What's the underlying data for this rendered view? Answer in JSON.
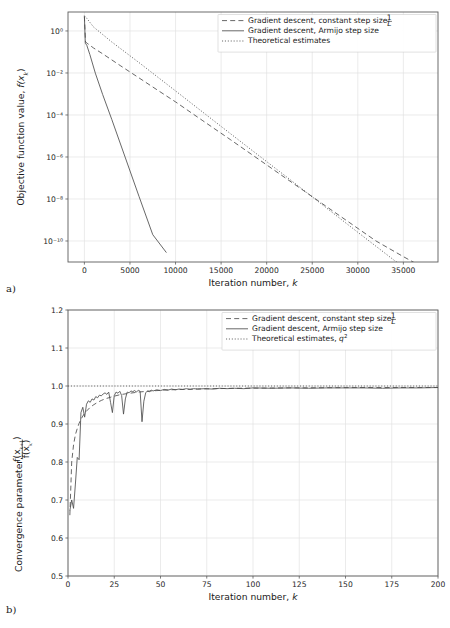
{
  "figure": {
    "panel_a_label": "a)",
    "panel_b_label": "b)",
    "background": "#ffffff",
    "line_color": "#4d4d4d",
    "grid_color": "#e3e3e3"
  },
  "chart_data": [
    {
      "id": "panel-a",
      "type": "line",
      "title": "",
      "xlabel": "Iteration number, k",
      "ylabel": "Objective function value, f(xₖ)",
      "ylabel_parts": {
        "prefix": "Objective function value, ",
        "func": "f(x",
        "sub": "k",
        "suffix": ")"
      },
      "xlabel_parts": {
        "prefix": "Iteration number, ",
        "var": "k"
      },
      "yscale": "log",
      "xscale": "linear",
      "xlim": [
        -1800,
        38800
      ],
      "ylim": [
        1e-11,
        8.0
      ],
      "xticks": [
        0,
        5000,
        10000,
        15000,
        20000,
        25000,
        30000,
        35000
      ],
      "xticklabels": [
        "0",
        "5000",
        "10000",
        "15000",
        "20000",
        "25000",
        "30000",
        "35000"
      ],
      "yticks": [
        1,
        0.01,
        0.0001,
        1e-06,
        1e-08,
        1e-10
      ],
      "yticklabels": [
        "10⁰",
        "10⁻²",
        "10⁻⁴",
        "10⁻⁶",
        "10⁻⁸",
        "10⁻¹⁰"
      ],
      "grid": true,
      "legend_position": "upper right",
      "series": [
        {
          "name": "Gradient descent, constant step size 1/L",
          "label_prefix": "Gradient descent, constant step size ",
          "label_frac_num": "1",
          "label_frac_den": "L",
          "style": "dashed",
          "x": [
            0,
            120,
            300,
            1000,
            2000,
            4000,
            6000,
            8000,
            10000,
            13000,
            16000,
            20000,
            24000,
            28000,
            32000,
            35000,
            37000
          ],
          "y": [
            5.0,
            0.3,
            0.26,
            0.155,
            0.082,
            0.0215,
            0.0058,
            0.00155,
            0.00042,
            5.3e-05,
            6.8e-06,
            4.2e-07,
            2.6e-08,
            1.6e-09,
            1e-10,
            1.8e-11,
            6e-12
          ]
        },
        {
          "name": "Gradient descent, Armijo step size",
          "label": "Gradient descent, Armijo step size",
          "style": "solid",
          "x": [
            0,
            100,
            260,
            600,
            1200,
            2000,
            3000,
            4500,
            6000,
            7500,
            9000
          ],
          "y": [
            5.0,
            0.26,
            0.21,
            0.075,
            0.0098,
            0.00095,
            6.2e-05,
            9e-07,
            1.3e-08,
            2e-10,
            2.8e-11
          ]
        },
        {
          "name": "Theoretical estimates",
          "label": "Theoretical estimates",
          "style": "dotted",
          "x": [
            0,
            200,
            1000,
            3000,
            6000,
            10000,
            14000,
            18000,
            22000,
            26000,
            30000,
            34000,
            37000
          ],
          "y": [
            5.4,
            4.3,
            1.55,
            0.3,
            0.031,
            0.0014,
            6.2e-05,
            2.8e-06,
            1.3e-07,
            5.8e-09,
            2.6e-10,
            1.2e-11,
            1.4e-12
          ]
        }
      ]
    },
    {
      "id": "panel-b",
      "type": "line",
      "title": "",
      "xlabel": "Iteration number, k",
      "ylabel": "Convergence parameter, f(xₖ₊₁)/f(xₖ)",
      "ylabel_parts": {
        "prefix": "Convergence parameter, ",
        "num": "f(x",
        "num_sub": "k+1",
        "num_end": ")",
        "den": "f(x",
        "den_sub": "k",
        "den_end": ")"
      },
      "xlabel_parts": {
        "prefix": "Iteration number, ",
        "var": "k"
      },
      "yscale": "linear",
      "xscale": "linear",
      "xlim": [
        0,
        200
      ],
      "ylim": [
        0.5,
        1.2
      ],
      "xticks": [
        0,
        25,
        50,
        75,
        100,
        125,
        150,
        175,
        200
      ],
      "xticklabels": [
        "0",
        "25",
        "50",
        "75",
        "100",
        "125",
        "150",
        "175",
        "200"
      ],
      "yticks": [
        0.5,
        0.6,
        0.7,
        0.8,
        0.9,
        1.0,
        1.1,
        1.2
      ],
      "yticklabels": [
        "0.5",
        "0.6",
        "0.7",
        "0.8",
        "0.9",
        "1.0",
        "1.1",
        "1.2"
      ],
      "grid": true,
      "legend_position": "upper right",
      "series": [
        {
          "name": "Gradient descent, constant step size 1/L",
          "label_prefix": "Gradient descent, constant step size ",
          "label_frac_num": "1",
          "label_frac_den": "L",
          "style": "dashed",
          "x": [
            1,
            2,
            3,
            4,
            5,
            6,
            7,
            8,
            9,
            10,
            12,
            14,
            16,
            18,
            20,
            24,
            28,
            32,
            38,
            45,
            55,
            70,
            90,
            120,
            160,
            200
          ],
          "y": [
            0.66,
            0.8,
            0.845,
            0.872,
            0.888,
            0.902,
            0.912,
            0.921,
            0.928,
            0.934,
            0.944,
            0.951,
            0.957,
            0.962,
            0.966,
            0.972,
            0.977,
            0.98,
            0.984,
            0.987,
            0.99,
            0.992,
            0.994,
            0.995,
            0.996,
            0.996
          ]
        },
        {
          "name": "Gradient descent, Armijo step size",
          "label": "Gradient descent, Armijo step size",
          "style": "solid",
          "x": [
            1,
            2,
            3,
            4,
            5,
            6,
            7,
            8,
            9,
            10,
            11,
            12,
            13,
            14,
            15,
            16,
            17,
            18,
            19,
            20,
            21,
            22,
            23,
            24,
            25,
            26,
            27,
            28,
            29,
            30,
            31,
            32,
            33,
            34,
            35,
            36,
            37,
            38,
            39,
            40,
            41,
            42,
            43,
            44,
            45,
            46,
            48,
            50,
            52,
            54,
            56,
            58,
            60,
            62,
            64,
            66,
            68,
            70,
            74,
            78,
            82,
            86,
            90,
            95,
            100,
            110,
            120,
            130,
            140,
            150,
            160,
            170,
            180,
            190,
            200
          ],
          "y": [
            0.672,
            0.7,
            0.678,
            0.742,
            0.812,
            0.806,
            0.93,
            0.944,
            0.918,
            0.952,
            0.961,
            0.957,
            0.966,
            0.963,
            0.972,
            0.969,
            0.976,
            0.974,
            0.979,
            0.982,
            0.978,
            0.984,
            0.957,
            0.93,
            0.975,
            0.984,
            0.981,
            0.986,
            0.975,
            0.926,
            0.966,
            0.984,
            0.982,
            0.987,
            0.985,
            0.988,
            0.984,
            0.989,
            0.986,
            0.906,
            0.96,
            0.982,
            0.987,
            0.985,
            0.989,
            0.987,
            0.99,
            0.988,
            0.991,
            0.989,
            0.992,
            0.99,
            0.992,
            0.991,
            0.993,
            0.991,
            0.993,
            0.992,
            0.993,
            0.992,
            0.994,
            0.993,
            0.994,
            0.993,
            0.995,
            0.994,
            0.995,
            0.994,
            0.995,
            0.995,
            0.995,
            0.994,
            0.995,
            0.995,
            0.996
          ]
        },
        {
          "name": "Theoretical estimates, q²",
          "label_prefix": "Theoretical estimates, ",
          "label_var": "q",
          "label_sup": "2",
          "style": "dotted",
          "x": [
            0,
            200
          ],
          "y": [
            1.0,
            1.0
          ]
        }
      ]
    }
  ]
}
